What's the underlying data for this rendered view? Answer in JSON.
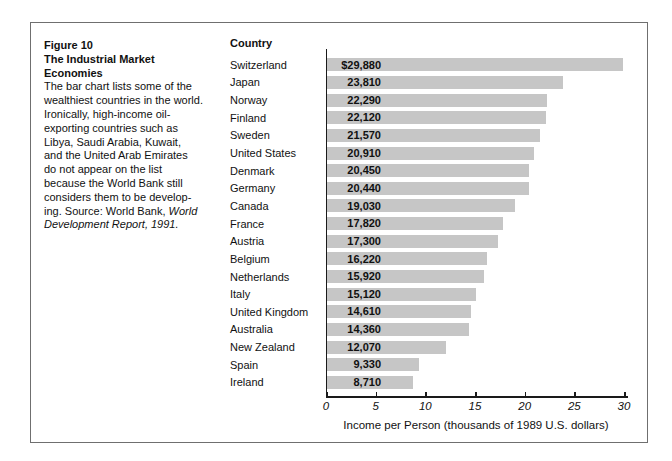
{
  "figure": {
    "figure_label": "Figure 10",
    "column_header": "Country",
    "caption": {
      "lines": [
        {
          "segments": [
            {
              "text": "Figure 10",
              "bold": true
            }
          ]
        },
        {
          "segments": [
            {
              "text": "The Industrial Market",
              "bold": true
            }
          ]
        },
        {
          "segments": [
            {
              "text": "Economies",
              "bold": true
            }
          ]
        },
        {
          "segments": [
            {
              "text": "The bar chart lists some of the"
            }
          ]
        },
        {
          "segments": [
            {
              "text": "wealthiest countries in the world."
            }
          ]
        },
        {
          "segments": [
            {
              "text": "Ironically, high-income oil-"
            }
          ]
        },
        {
          "segments": [
            {
              "text": "exporting countries such as"
            }
          ]
        },
        {
          "segments": [
            {
              "text": "Libya, Saudi Arabia, Kuwait,"
            }
          ]
        },
        {
          "segments": [
            {
              "text": "and the United Arab Emirates"
            }
          ]
        },
        {
          "segments": [
            {
              "text": "do not appear on the list"
            }
          ]
        },
        {
          "segments": [
            {
              "text": "because the World Bank still"
            }
          ]
        },
        {
          "segments": [
            {
              "text": "considers them to be develop-"
            }
          ]
        },
        {
          "segments": [
            {
              "text": "ing. Source: World Bank, "
            },
            {
              "text": "World",
              "italic": true
            }
          ]
        },
        {
          "segments": [
            {
              "text": "Development Report, 1991.",
              "italic": true
            }
          ]
        }
      ]
    }
  },
  "chart_data": {
    "type": "bar",
    "orientation": "horizontal",
    "categories": [
      "Switzerland",
      "Japan",
      "Norway",
      "Finland",
      "Sweden",
      "United States",
      "Denmark",
      "Germany",
      "Canada",
      "France",
      "Austria",
      "Belgium",
      "Netherlands",
      "Italy",
      "United Kingdom",
      "Australia",
      "New Zealand",
      "Spain",
      "Ireland"
    ],
    "values": [
      29880,
      23810,
      22290,
      22120,
      21570,
      20910,
      20450,
      20440,
      19030,
      17820,
      17300,
      16220,
      15920,
      15120,
      14610,
      14360,
      12070,
      9330,
      8710
    ],
    "value_labels": [
      "$29,880",
      "23,810",
      "22,290",
      "22,120",
      "21,570",
      "20,910",
      "20,450",
      "20,440",
      "19,030",
      "17,820",
      "17,300",
      "16,220",
      "15,920",
      "15,120",
      "14,610",
      "14,360",
      "12,070",
      "9,330",
      "8,710"
    ],
    "xlabel": "Income per Person (thousands of 1989 U.S. dollars)",
    "xlim": [
      0,
      30
    ],
    "x_ticks": [
      0,
      5,
      10,
      15,
      20,
      25,
      30
    ],
    "grid": false,
    "legend": "none",
    "bar_color": "#c6c6c6",
    "axis_color": "#1a1a1a"
  }
}
